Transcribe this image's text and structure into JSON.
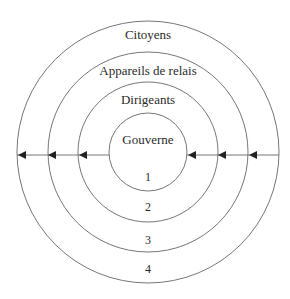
{
  "diagram": {
    "type": "concentric-circles",
    "rings": [
      {
        "label": "Gouverne",
        "number": "1"
      },
      {
        "label": "Dirigeants",
        "number": "2"
      },
      {
        "label": "Appareils de relais",
        "number": "3"
      },
      {
        "label": "Citoyens",
        "number": "4"
      }
    ],
    "arrows": {
      "direction": "inward-leftward",
      "count": 6
    },
    "colors": {
      "line": "#555555",
      "text": "#2a2a2a"
    }
  }
}
